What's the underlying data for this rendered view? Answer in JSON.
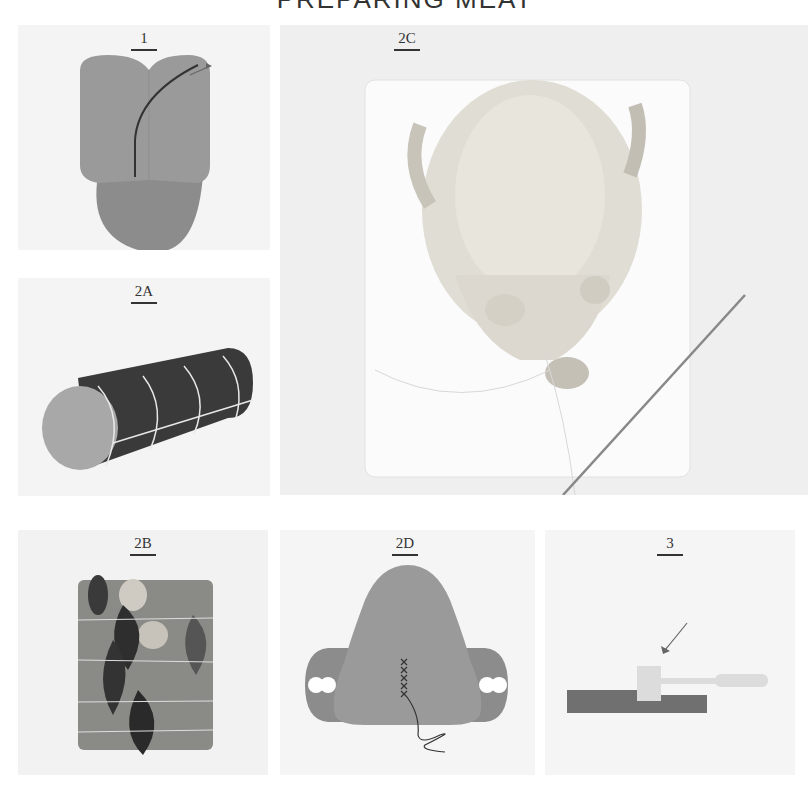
{
  "page": {
    "title": "PREPARING MEAT"
  },
  "panels": [
    {
      "id": "1",
      "label": "1",
      "kind": "diagram",
      "description": "boning a leg: cut along the bone"
    },
    {
      "id": "2A",
      "label": "2A",
      "kind": "diagram",
      "description": "rolled roast tied with string"
    },
    {
      "id": "2B",
      "label": "2B",
      "kind": "photo",
      "description": "rolled meat with herbs tied with string"
    },
    {
      "id": "2C",
      "label": "2C",
      "kind": "photo",
      "description": "trussed chicken on cutting board with trussing needle"
    },
    {
      "id": "2D",
      "label": "2D",
      "kind": "diagram",
      "description": "sewing closed the cavity"
    },
    {
      "id": "3",
      "label": "3",
      "kind": "diagram",
      "description": "pounding meat with a mallet"
    }
  ],
  "colors": {
    "panel_bg": "#f4f4f4",
    "meat_light": "#9a9a9a",
    "meat_mid": "#8c8c8c",
    "meat_dark": "#3a3a3a",
    "string": "#e8e8e8",
    "mallet": "#dcdcdc",
    "board": "#707070"
  }
}
